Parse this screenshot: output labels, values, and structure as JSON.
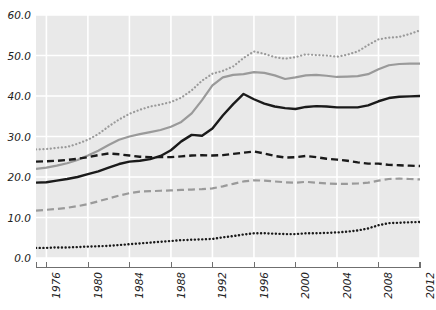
{
  "chart_data": {
    "type": "line",
    "title": "",
    "subtitle": "",
    "xlabel": "",
    "ylabel": "",
    "xlim": [
      1975,
      2012
    ],
    "ylim": [
      0,
      60
    ],
    "grid": true,
    "legend_position": "none",
    "x": [
      1975,
      1976,
      1977,
      1978,
      1979,
      1980,
      1981,
      1982,
      1983,
      1984,
      1985,
      1986,
      1987,
      1988,
      1989,
      1990,
      1991,
      1992,
      1993,
      1994,
      1995,
      1996,
      1997,
      1998,
      1999,
      2000,
      2001,
      2002,
      2003,
      2004,
      2005,
      2006,
      2007,
      2008,
      2009,
      2010,
      2011,
      2012
    ],
    "y_ticks": [
      0.0,
      10.0,
      20.0,
      30.0,
      40.0,
      50.0,
      60.0
    ],
    "y_tick_labels": [
      "0.0",
      "10.0",
      "20.0",
      "30.0",
      "40.0",
      "50.0",
      "60.0"
    ],
    "x_ticks": [
      1976,
      1980,
      1984,
      1988,
      1992,
      1996,
      2000,
      2004,
      2008,
      2012
    ],
    "x_tick_labels": [
      "1976",
      "1980",
      "1984",
      "1988",
      "1992",
      "1996",
      "2000",
      "2004",
      "2008",
      "2012"
    ],
    "series": [
      {
        "name": "series-1-gray-dotted",
        "style": "dotted",
        "color": "#9a9a9a",
        "width": 2.2,
        "values": [
          26.8,
          26.9,
          27.2,
          27.4,
          28.2,
          29.2,
          30.6,
          32.5,
          34.2,
          35.6,
          36.6,
          37.4,
          37.9,
          38.5,
          39.6,
          41.4,
          43.8,
          45.5,
          46.2,
          47.3,
          49.4,
          51.0,
          50.4,
          49.6,
          49.2,
          49.6,
          50.3,
          50.1,
          50.0,
          49.7,
          50.2,
          51.0,
          52.6,
          54.0,
          54.4,
          54.6,
          55.3,
          56.2
        ]
      },
      {
        "name": "series-2-gray-solid",
        "style": "solid",
        "color": "#9a9a9a",
        "width": 2.2,
        "values": [
          22.0,
          22.3,
          22.8,
          23.4,
          24.2,
          25.3,
          26.5,
          27.9,
          29.2,
          30.0,
          30.6,
          31.1,
          31.6,
          32.4,
          33.6,
          35.7,
          39.0,
          42.6,
          44.6,
          45.2,
          45.4,
          45.9,
          45.7,
          45.1,
          44.2,
          44.6,
          45.1,
          45.2,
          45.0,
          44.7,
          44.8,
          44.9,
          45.4,
          46.6,
          47.6,
          47.9,
          48.0,
          48.0
        ]
      },
      {
        "name": "series-3-black-solid",
        "style": "solid",
        "color": "#1a1a1a",
        "width": 2.4,
        "values": [
          18.6,
          18.7,
          19.1,
          19.5,
          20.0,
          20.7,
          21.4,
          22.3,
          23.2,
          23.8,
          24.0,
          24.4,
          25.2,
          26.6,
          28.8,
          30.4,
          30.2,
          32.0,
          35.2,
          38.0,
          40.5,
          39.2,
          38.1,
          37.4,
          37.0,
          36.8,
          37.3,
          37.5,
          37.4,
          37.2,
          37.2,
          37.2,
          37.7,
          38.7,
          39.5,
          39.8,
          39.9,
          40.0
        ]
      },
      {
        "name": "series-4-black-dashed",
        "style": "dashed",
        "color": "#1a1a1a",
        "width": 2.4,
        "values": [
          23.8,
          23.9,
          24.0,
          24.2,
          24.5,
          24.9,
          25.4,
          25.8,
          25.6,
          25.3,
          25.0,
          24.9,
          24.9,
          24.9,
          25.1,
          25.3,
          25.4,
          25.3,
          25.4,
          25.7,
          26.0,
          26.3,
          25.8,
          25.2,
          24.8,
          24.9,
          25.2,
          24.9,
          24.5,
          24.3,
          24.0,
          23.6,
          23.3,
          23.3,
          23.0,
          22.9,
          22.8,
          22.7
        ]
      },
      {
        "name": "series-5-gray-dashed",
        "style": "dashed",
        "color": "#9a9a9a",
        "width": 2.2,
        "values": [
          11.7,
          11.9,
          12.1,
          12.4,
          12.8,
          13.3,
          14.0,
          14.7,
          15.4,
          16.0,
          16.4,
          16.5,
          16.6,
          16.7,
          16.8,
          16.9,
          17.0,
          17.2,
          17.7,
          18.3,
          18.9,
          19.2,
          19.1,
          18.9,
          18.7,
          18.6,
          18.8,
          18.6,
          18.4,
          18.3,
          18.3,
          18.4,
          18.6,
          19.1,
          19.5,
          19.6,
          19.5,
          19.4
        ]
      },
      {
        "name": "series-6-black-dotted",
        "style": "dotted",
        "color": "#1a1a1a",
        "width": 2.4,
        "values": [
          2.5,
          2.5,
          2.6,
          2.6,
          2.7,
          2.8,
          2.9,
          3.0,
          3.2,
          3.4,
          3.6,
          3.8,
          4.0,
          4.2,
          4.4,
          4.5,
          4.6,
          4.7,
          5.1,
          5.4,
          5.8,
          6.1,
          6.1,
          6.0,
          5.9,
          5.9,
          6.1,
          6.1,
          6.2,
          6.3,
          6.5,
          6.8,
          7.3,
          8.1,
          8.6,
          8.7,
          8.8,
          8.9
        ]
      }
    ]
  },
  "style": {
    "plot_background": "#e9e9e9",
    "gridline_color": "#ffffff",
    "axis_color": "#6f6f6f",
    "tick_label_color": "#222222"
  }
}
